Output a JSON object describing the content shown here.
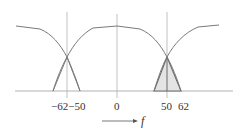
{
  "diagram": {
    "type": "spectrum",
    "colors": {
      "curve": "#7a7a7a",
      "axis": "#9a9a9a",
      "triangle_stroke": "#6a6a6a",
      "triangle_fill": "#e4e4e4",
      "text": "#333333"
    },
    "tick_labels": {
      "neg62_neg50": "−62−50",
      "zero": "0",
      "fifty": "50",
      "sixtytwo": "62"
    },
    "axis_label": "f",
    "arrow": "frequency-axis-arrow"
  }
}
